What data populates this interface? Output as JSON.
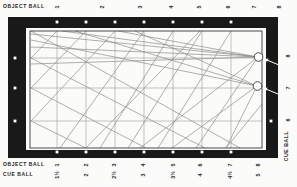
{
  "labels": {
    "top_object_ball": "OBJECT BALL",
    "bottom_object_ball": "OBJECT BALL",
    "bottom_cue_ball": "CUE BALL",
    "right_cue_ball": "CUE BALL"
  },
  "scales": {
    "top_object": {
      "labels": [
        "1",
        "2",
        "3",
        "4",
        "5",
        "6",
        "7",
        "8"
      ],
      "x": [
        57,
        102,
        140,
        171,
        199,
        228,
        254,
        279
      ],
      "y": 7
    },
    "bottom_object": {
      "labels": [
        "1",
        "2",
        "3",
        "4",
        "5",
        "6",
        "7",
        "8"
      ],
      "x": [
        57,
        86,
        114,
        143,
        173,
        200,
        230,
        258
      ],
      "y": 165
    },
    "bottom_cue": {
      "labels": [
        "1½",
        "2",
        "2½",
        "3",
        "3½",
        "4",
        "4½",
        "5"
      ],
      "x": [
        57,
        86,
        114,
        143,
        173,
        200,
        230,
        258
      ],
      "y": 175
    },
    "right_cue": {
      "labels": [
        "8",
        "7",
        "6"
      ],
      "x": 288,
      "y": [
        56,
        88,
        120
      ]
    }
  },
  "diagram": {
    "rail_rect": [
      8,
      17,
      270,
      141
    ],
    "gap_rect": [
      26,
      28,
      240,
      122
    ],
    "cushion_rect": [
      30,
      31,
      232,
      117
    ],
    "diamonds": {
      "top_x": [
        57,
        86,
        115,
        144,
        173,
        202,
        231
      ],
      "top_y": 22,
      "bottom_x": [
        57,
        86,
        115,
        144,
        173,
        202,
        231
      ],
      "bottom_y": 152,
      "left_y": [
        58,
        88,
        121
      ],
      "left_x": 15,
      "right_y": [
        121
      ],
      "right_x": 271
    },
    "grid": {
      "vertical_x": [
        57,
        86,
        115,
        144,
        173,
        202,
        231
      ],
      "horizontal_y": [
        58,
        88,
        121
      ],
      "x_range": [
        30,
        262
      ],
      "y_range": [
        31,
        148
      ]
    },
    "balls": [
      {
        "name": "cue-ball-8",
        "cx": 258.5,
        "cy": 57,
        "r": 4.3
      },
      {
        "name": "cue-ball-7",
        "cx": 257.5,
        "cy": 86,
        "r": 4.3
      }
    ],
    "arrows": [
      {
        "x1": 279,
        "y1": 65,
        "x2": 264.5,
        "y2": 59
      },
      {
        "x1": 278,
        "y1": 94,
        "x2": 263.5,
        "y2": 88
      }
    ],
    "tracks": [
      [
        31,
        34,
        258,
        57
      ],
      [
        31,
        47,
        258,
        57
      ],
      [
        31,
        64,
        258,
        57
      ],
      [
        62,
        31,
        258,
        57
      ],
      [
        118,
        31,
        258,
        57
      ],
      [
        140,
        148,
        258,
        57
      ],
      [
        31,
        40,
        257,
        86
      ],
      [
        75,
        31,
        257,
        86
      ],
      [
        135,
        31,
        257,
        86
      ],
      [
        172,
        148,
        257,
        86
      ],
      [
        31,
        31,
        240,
        148
      ],
      [
        31,
        58,
        205,
        148
      ],
      [
        31,
        88,
        146,
        148
      ],
      [
        31,
        121,
        86,
        148
      ],
      [
        86,
        148,
        200,
        31
      ],
      [
        86,
        31,
        31,
        88
      ],
      [
        115,
        31,
        31,
        121
      ],
      [
        144,
        31,
        60,
        148
      ],
      [
        173,
        31,
        100,
        148
      ],
      [
        202,
        31,
        128,
        148
      ],
      [
        231,
        31,
        158,
        148
      ],
      [
        258,
        57,
        196,
        148
      ],
      [
        257,
        86,
        226,
        148
      ],
      [
        226,
        148,
        262,
        104
      ],
      [
        57,
        31,
        31,
        58
      ]
    ]
  },
  "colors": {
    "rail": "#191919",
    "paper": "#fbfbfa",
    "grid_line": "#9c9c9c",
    "track_line": "#8c8c8c",
    "cushion_line": "#4a4a4a",
    "text": "#1e1e1e"
  }
}
